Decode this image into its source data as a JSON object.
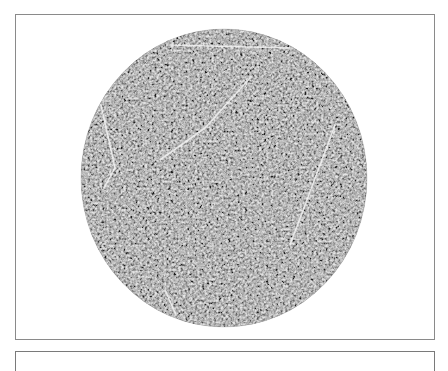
{
  "figure": {
    "type": "textured-disc-micrograph",
    "panels": [
      {
        "id": "top",
        "content": "circular region with fine labyrinthine texture and faint white linear streaks"
      },
      {
        "id": "bottom",
        "content": "next panel (cut off)"
      }
    ],
    "disc": {
      "center_x": 224,
      "center_y": 178,
      "radius_x": 143,
      "radius_y": 149,
      "base_color": "#8c8c8c",
      "dark_color": "#2e2e2e",
      "light_color": "#e6e6e6"
    },
    "streaks": [
      {
        "x1": 170,
        "y1": 45,
        "x2": 290,
        "y2": 48
      },
      {
        "x1": 101,
        "y1": 105,
        "x2": 115,
        "y2": 168
      },
      {
        "x1": 115,
        "y1": 168,
        "x2": 104,
        "y2": 188
      },
      {
        "x1": 250,
        "y1": 78,
        "x2": 205,
        "y2": 128
      },
      {
        "x1": 205,
        "y1": 128,
        "x2": 160,
        "y2": 160
      },
      {
        "x1": 335,
        "y1": 125,
        "x2": 290,
        "y2": 245
      },
      {
        "x1": 165,
        "y1": 290,
        "x2": 176,
        "y2": 315
      }
    ],
    "frame_color": "#7a7a7a"
  }
}
